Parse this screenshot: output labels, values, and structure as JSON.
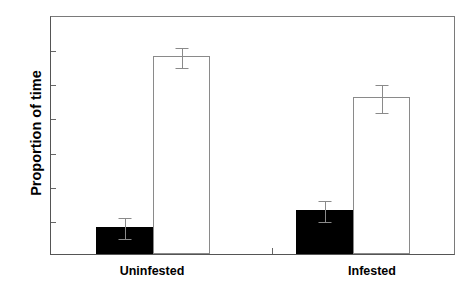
{
  "chart_data": {
    "type": "bar",
    "title": "",
    "xlabel": "",
    "ylabel": "Proportion of time",
    "ylim": [
      0.0,
      0.7
    ],
    "yticks": [
      "0.0",
      "0.1",
      "0.2",
      "0.3",
      "0.4",
      "0.5",
      "0.6",
      "0.7"
    ],
    "ytick_values": [
      0.0,
      0.1,
      0.2,
      0.3,
      0.4,
      0.5,
      0.6,
      0.7
    ],
    "grid": false,
    "legend": null,
    "categories": [
      "Uninfested",
      "Infested"
    ],
    "series": [
      {
        "name": "filled",
        "fill": "#000000",
        "values": [
          0.08,
          0.13
        ],
        "errors": [
          0.03,
          0.03
        ]
      },
      {
        "name": "open",
        "fill": "#ffffff",
        "values": [
          0.58,
          0.46
        ],
        "errors": [
          0.03,
          0.04
        ]
      }
    ]
  },
  "axis": {
    "y_title": "Proportion of time",
    "tick_labels": [
      "0.7",
      "0.6",
      "0.5",
      "0.4",
      "0.3",
      "0.2",
      "0.1",
      "0.0"
    ],
    "group_labels": [
      "Uninfested",
      "Infested"
    ]
  },
  "colors": {
    "filled_bar": "#000000",
    "open_bar": "#ffffff",
    "bar_outline": "#8a8a8a",
    "axis": "#555555",
    "text": "#000000"
  }
}
